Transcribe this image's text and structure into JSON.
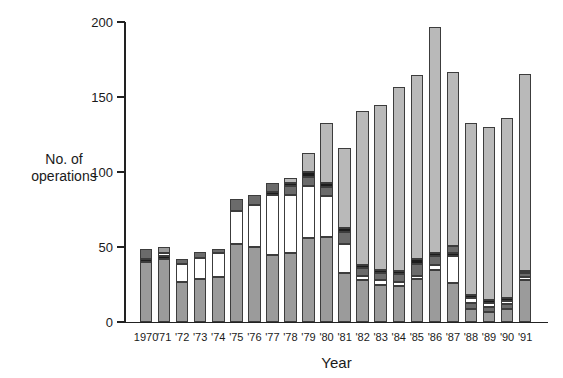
{
  "chart_data": {
    "type": "bar",
    "stacked": true,
    "title": "",
    "xlabel": "Year",
    "ylabel": "No. of operations",
    "ylabel_lines": [
      "No. of",
      "operations"
    ],
    "ylim": [
      0,
      200
    ],
    "yticks": [
      0,
      50,
      100,
      150,
      200
    ],
    "grid": false,
    "legend": "none",
    "categories": [
      "1970",
      "'71",
      "'72",
      "'73",
      "'74",
      "'75",
      "'76",
      "'77",
      "'78",
      "'79",
      "'80",
      "'81",
      "'82",
      "'83",
      "'84",
      "'85",
      "'86",
      "'87",
      "'88",
      "'89",
      "'90",
      "'91"
    ],
    "totals": [
      49,
      50,
      42,
      47,
      49,
      82,
      85,
      93,
      96,
      113,
      133,
      116,
      141,
      145,
      157,
      165,
      197,
      167,
      133,
      130,
      136,
      165
    ],
    "segment_colors": {
      "gray": "#9b9b9b",
      "white": "#ffffff",
      "dark": "#6b6b6b",
      "black": "#1c1c1c",
      "light": "#b9b9b9"
    },
    "bars": [
      {
        "year": "1970",
        "total": 49,
        "segments": [
          {
            "color": "gray",
            "value": 40
          },
          {
            "color": "black",
            "value": 2
          },
          {
            "color": "dark",
            "value": 7
          }
        ]
      },
      {
        "year": "'71",
        "total": 50,
        "segments": [
          {
            "color": "gray",
            "value": 42
          },
          {
            "color": "black",
            "value": 2
          },
          {
            "color": "white",
            "value": 2
          },
          {
            "color": "gray",
            "value": 4
          }
        ]
      },
      {
        "year": "'72",
        "total": 42,
        "segments": [
          {
            "color": "gray",
            "value": 27
          },
          {
            "color": "white",
            "value": 12
          },
          {
            "color": "dark",
            "value": 3
          }
        ]
      },
      {
        "year": "'73",
        "total": 47,
        "segments": [
          {
            "color": "gray",
            "value": 29
          },
          {
            "color": "white",
            "value": 14
          },
          {
            "color": "dark",
            "value": 4
          }
        ]
      },
      {
        "year": "'74",
        "total": 49,
        "segments": [
          {
            "color": "gray",
            "value": 30
          },
          {
            "color": "white",
            "value": 16
          },
          {
            "color": "dark",
            "value": 3
          }
        ]
      },
      {
        "year": "'75",
        "total": 82,
        "segments": [
          {
            "color": "gray",
            "value": 52
          },
          {
            "color": "white",
            "value": 22
          },
          {
            "color": "dark",
            "value": 8
          }
        ]
      },
      {
        "year": "'76",
        "total": 85,
        "segments": [
          {
            "color": "gray",
            "value": 50
          },
          {
            "color": "white",
            "value": 28
          },
          {
            "color": "dark",
            "value": 7
          }
        ]
      },
      {
        "year": "'77",
        "total": 93,
        "segments": [
          {
            "color": "gray",
            "value": 45
          },
          {
            "color": "white",
            "value": 40
          },
          {
            "color": "black",
            "value": 2
          },
          {
            "color": "dark",
            "value": 6
          }
        ]
      },
      {
        "year": "'78",
        "total": 96,
        "segments": [
          {
            "color": "gray",
            "value": 46
          },
          {
            "color": "white",
            "value": 39
          },
          {
            "color": "dark",
            "value": 6
          },
          {
            "color": "black",
            "value": 2
          },
          {
            "color": "light",
            "value": 3
          }
        ]
      },
      {
        "year": "'79",
        "total": 113,
        "segments": [
          {
            "color": "gray",
            "value": 56
          },
          {
            "color": "white",
            "value": 35
          },
          {
            "color": "dark",
            "value": 6
          },
          {
            "color": "black",
            "value": 3
          },
          {
            "color": "light",
            "value": 13
          }
        ]
      },
      {
        "year": "'80",
        "total": 133,
        "segments": [
          {
            "color": "gray",
            "value": 57
          },
          {
            "color": "white",
            "value": 27
          },
          {
            "color": "dark",
            "value": 6
          },
          {
            "color": "black",
            "value": 3
          },
          {
            "color": "light",
            "value": 40
          }
        ]
      },
      {
        "year": "'81",
        "total": 116,
        "segments": [
          {
            "color": "gray",
            "value": 33
          },
          {
            "color": "white",
            "value": 19
          },
          {
            "color": "dark",
            "value": 8
          },
          {
            "color": "black",
            "value": 3
          },
          {
            "color": "light",
            "value": 53
          }
        ]
      },
      {
        "year": "'82",
        "total": 141,
        "segments": [
          {
            "color": "gray",
            "value": 28
          },
          {
            "color": "white",
            "value": 3
          },
          {
            "color": "dark",
            "value": 5
          },
          {
            "color": "black",
            "value": 2
          },
          {
            "color": "light",
            "value": 103
          }
        ]
      },
      {
        "year": "'83",
        "total": 145,
        "segments": [
          {
            "color": "gray",
            "value": 25
          },
          {
            "color": "white",
            "value": 3
          },
          {
            "color": "dark",
            "value": 5
          },
          {
            "color": "black",
            "value": 2
          },
          {
            "color": "light",
            "value": 110
          }
        ]
      },
      {
        "year": "'84",
        "total": 157,
        "segments": [
          {
            "color": "gray",
            "value": 24
          },
          {
            "color": "white",
            "value": 3
          },
          {
            "color": "dark",
            "value": 5
          },
          {
            "color": "black",
            "value": 2
          },
          {
            "color": "light",
            "value": 123
          }
        ]
      },
      {
        "year": "'85",
        "total": 165,
        "segments": [
          {
            "color": "gray",
            "value": 29
          },
          {
            "color": "white",
            "value": 2
          },
          {
            "color": "dark",
            "value": 8
          },
          {
            "color": "black",
            "value": 3
          },
          {
            "color": "light",
            "value": 123
          }
        ]
      },
      {
        "year": "'86",
        "total": 197,
        "segments": [
          {
            "color": "gray",
            "value": 35
          },
          {
            "color": "white",
            "value": 3
          },
          {
            "color": "dark",
            "value": 6
          },
          {
            "color": "black",
            "value": 2
          },
          {
            "color": "light",
            "value": 151
          }
        ]
      },
      {
        "year": "'87",
        "total": 167,
        "segments": [
          {
            "color": "gray",
            "value": 26
          },
          {
            "color": "white",
            "value": 18
          },
          {
            "color": "black",
            "value": 2
          },
          {
            "color": "dark",
            "value": 5
          },
          {
            "color": "light",
            "value": 116
          }
        ]
      },
      {
        "year": "'88",
        "total": 133,
        "segments": [
          {
            "color": "gray",
            "value": 9
          },
          {
            "color": "dark",
            "value": 4
          },
          {
            "color": "white",
            "value": 3
          },
          {
            "color": "black",
            "value": 2
          },
          {
            "color": "light",
            "value": 115
          }
        ]
      },
      {
        "year": "'89",
        "total": 130,
        "segments": [
          {
            "color": "gray",
            "value": 7
          },
          {
            "color": "dark",
            "value": 3
          },
          {
            "color": "white",
            "value": 3
          },
          {
            "color": "black",
            "value": 2
          },
          {
            "color": "light",
            "value": 115
          }
        ]
      },
      {
        "year": "'90",
        "total": 136,
        "segments": [
          {
            "color": "gray",
            "value": 9
          },
          {
            "color": "dark",
            "value": 3
          },
          {
            "color": "white",
            "value": 2
          },
          {
            "color": "black",
            "value": 2
          },
          {
            "color": "light",
            "value": 120
          }
        ]
      },
      {
        "year": "'91",
        "total": 165,
        "segments": [
          {
            "color": "gray",
            "value": 28
          },
          {
            "color": "white",
            "value": 2
          },
          {
            "color": "dark",
            "value": 3
          },
          {
            "color": "black",
            "value": 1
          },
          {
            "color": "light",
            "value": 131
          }
        ]
      }
    ]
  }
}
